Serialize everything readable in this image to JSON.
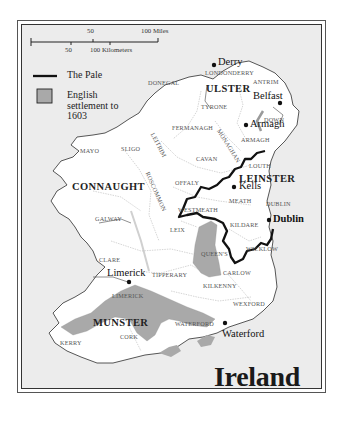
{
  "map": {
    "title": "Ireland",
    "colors": {
      "sea": "#ececec",
      "land": "#ffffff",
      "coastline": "#444444",
      "county_border": "#aaaaaa",
      "pale_line": "#111111",
      "english_settlement": "#a9a9a9"
    }
  },
  "scale_bar": {
    "miles_label_50": "50",
    "miles_label_100": "100 Miles",
    "km_label_50": "50",
    "km_label_100": "100 Kilometers"
  },
  "legend": {
    "items": [
      {
        "icon": "pale-line-icon",
        "label": "The Pale"
      },
      {
        "icon": "settlement-swatch-icon",
        "label_lines": [
          "English",
          "settlement to",
          "1603"
        ]
      }
    ]
  },
  "provinces": {
    "ulster": "ULSTER",
    "connaught": "CONNAUGHT",
    "leinster": "LEINSTER",
    "munster": "MUNSTER"
  },
  "counties": {
    "donegal": "DONEGAL",
    "londonderry": "LONDONDERRY",
    "antrim": "ANTRIM",
    "tyrone": "TYRONE",
    "down": "DOWN",
    "fermanagh": "FERMANAGH",
    "monaghan": "MONAGHAN",
    "armagh": "ARMAGH",
    "mayo": "MAYO",
    "sligo": "SLIGO",
    "leitrim": "LEITRIM",
    "cavan": "CAVAN",
    "louth": "LOUTH",
    "roscommon": "ROSCOMMON",
    "offaly": "OFFALY",
    "meath": "MEATH",
    "westmeath": "WESTMEATH",
    "galway": "GALWAY",
    "dublin": "DUBLIN",
    "leix": "LEIX",
    "kildare": "KILDARE",
    "queens": "QUEEN'S",
    "wicklow": "WICKLOW",
    "clare": "CLARE",
    "tipperary": "TIPPERARY",
    "carlow": "CARLOW",
    "kilkenny": "KILKENNY",
    "limerick": "LIMERICK",
    "wexford": "WEXFORD",
    "waterford": "WATERFORD",
    "kerry": "KERRY",
    "cork": "CORK"
  },
  "towns": {
    "derry": "Derry",
    "belfast": "Belfast",
    "armagh": "Armagh",
    "kells": "Kells",
    "dublin": "Dublin",
    "limerick": "Limerick",
    "waterford": "Waterford"
  }
}
